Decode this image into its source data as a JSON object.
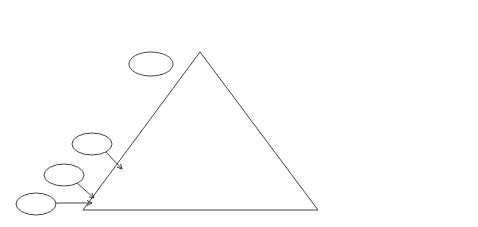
{
  "diagram": {
    "central_block": {
      "label": "C",
      "subscript": "σ\\n"
    },
    "inputs": [
      {
        "id": "u1",
        "base": "U",
        "sub": "1"
      },
      {
        "id": "u2",
        "base": "U",
        "sub": "2"
      },
      {
        "id": "u3",
        "base": "U",
        "sub": "3"
      },
      {
        "id": "un1",
        "base": "U",
        "sub": "n−1"
      },
      {
        "id": "un",
        "base": "U",
        "sub": "n"
      }
    ],
    "outputs": [
      {
        "id": "us1",
        "base": "U",
        "sub": "σ(1)"
      },
      {
        "id": "us2",
        "base": "U",
        "sub": "σ(2)"
      },
      {
        "id": "us3",
        "base": "U",
        "sub": "σ(3)"
      },
      {
        "id": "usn1",
        "base": "U",
        "sub": "σ(n−1)"
      },
      {
        "id": "usn",
        "base": "U",
        "sub": "σ(n)"
      }
    ],
    "qs_boxes": [
      {
        "id": "qs-n",
        "label": "QS",
        "control": {
          "base": "x",
          "sub": "n",
          "sup": "(n)"
        }
      },
      {
        "id": "qs-n1",
        "label": "QS",
        "control": {
          "base": "x",
          "sub": "n−1",
          "sup": "(n)"
        }
      },
      {
        "id": "qs-3",
        "label": "QS",
        "control": {
          "base": "x",
          "sub": "3",
          "sup": "(n)"
        }
      },
      {
        "id": "qs-2",
        "label": "QS",
        "control": {
          "base": "x",
          "sub": "2",
          "sup": "(n)"
        }
      }
    ],
    "ellipsis": "......"
  }
}
